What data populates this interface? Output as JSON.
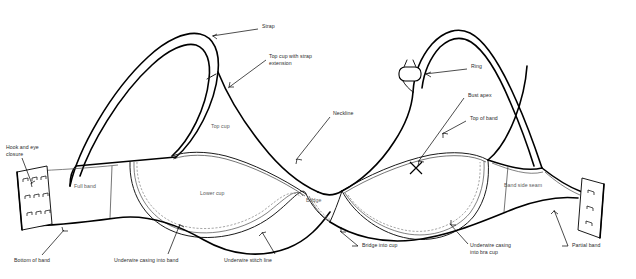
{
  "diagram": {
    "background_color": "#ffffff",
    "line_color": "#000000",
    "label_color": "#2b2b2b",
    "label_color_faint": "#5a5a5a",
    "width": 636,
    "height": 279
  },
  "labels": [
    {
      "id": "strap",
      "text": "Strap",
      "x": 262,
      "y": 26,
      "style": "plain"
    },
    {
      "id": "top-cup-strap-ext",
      "text": "Top cup with strap\nextension",
      "x": 269,
      "y": 56,
      "style": "plain"
    },
    {
      "id": "top-cup",
      "text": "Top cup",
      "x": 211,
      "y": 126,
      "style": "faint"
    },
    {
      "id": "neckline",
      "text": "Neckline",
      "x": 333,
      "y": 113,
      "style": "plain"
    },
    {
      "id": "ring",
      "text": "Ring",
      "x": 471,
      "y": 66,
      "style": "plain"
    },
    {
      "id": "bust-apex",
      "text": "Bust apex",
      "x": 468,
      "y": 95,
      "style": "plain"
    },
    {
      "id": "top-of-band",
      "text": "Top of band",
      "x": 470,
      "y": 118,
      "style": "plain"
    },
    {
      "id": "hook-and-eye",
      "text": "Hook and eye\nclosure",
      "x": 6,
      "y": 147,
      "style": "plain"
    },
    {
      "id": "full-band",
      "text": "Full band",
      "x": 74,
      "y": 186,
      "style": "faint"
    },
    {
      "id": "lower-cup",
      "text": "Lower cup",
      "x": 200,
      "y": 193,
      "style": "faint"
    },
    {
      "id": "bridge",
      "text": "Bridge",
      "x": 306,
      "y": 200,
      "style": "faint"
    },
    {
      "id": "band-side-seam",
      "text": "Band side seam",
      "x": 504,
      "y": 185,
      "style": "faint"
    },
    {
      "id": "bottom-of-band",
      "text": "Bottom of band",
      "x": 14,
      "y": 260,
      "style": "plain"
    },
    {
      "id": "underwire-casing-band",
      "text": "Underwire casing into band",
      "x": 114,
      "y": 260,
      "style": "plain"
    },
    {
      "id": "underwire-stitch-line",
      "text": "Underwire stitch line",
      "x": 224,
      "y": 260,
      "style": "plain"
    },
    {
      "id": "bridge-into-cup",
      "text": "Bridge into cup",
      "x": 362,
      "y": 245,
      "style": "plain"
    },
    {
      "id": "underwire-casing-cup",
      "text": "Underwire casing\ninto bra cup",
      "x": 470,
      "y": 245,
      "style": "plain"
    },
    {
      "id": "partial-band",
      "text": "Partial band",
      "x": 572,
      "y": 245,
      "style": "plain"
    }
  ],
  "parts": [
    "Strap",
    "Top cup with strap extension",
    "Top cup",
    "Neckline",
    "Ring",
    "Bust apex",
    "Top of band",
    "Hook and eye closure",
    "Full band",
    "Lower cup",
    "Bridge",
    "Band side seam",
    "Bottom of band",
    "Underwire casing into band",
    "Underwire stitch line",
    "Bridge into cup",
    "Underwire casing into bra cup",
    "Partial band"
  ],
  "hook_closure": {
    "rows": 3,
    "columns": 3,
    "side": "left"
  },
  "partial_band_closure": {
    "rows": 3,
    "columns": 1,
    "side": "right"
  },
  "bust_apex_marker": "x-cross"
}
